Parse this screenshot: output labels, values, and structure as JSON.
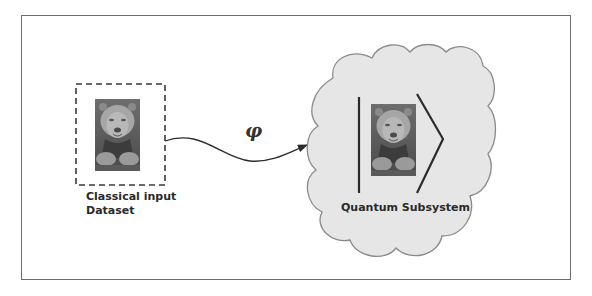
{
  "diagram": {
    "input": {
      "label_line1": "Classical input",
      "label_line2": "Dataset",
      "image": "lion-photo"
    },
    "mapping": {
      "symbol": "φ"
    },
    "quantum": {
      "label": "Quantum Subsystem",
      "image": "lion-photo",
      "notation": "ket"
    },
    "colors": {
      "frame": "#6b6b6b",
      "cloud_fill": "#e6e6e6",
      "cloud_stroke": "#8a8a8a",
      "line": "#2b2b2b"
    }
  }
}
